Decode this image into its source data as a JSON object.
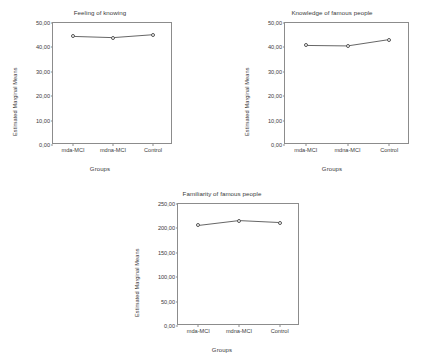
{
  "figure": {
    "background": "#ffffff",
    "axis_color": "#8c8c8c",
    "line_color": "#555555",
    "marker_fill": "#ffffff"
  },
  "chart_data": [
    {
      "type": "line",
      "title": "Feeling of knowing",
      "xlabel": "Groups",
      "ylabel": "Estimated Marginal Means",
      "categories": [
        "mda-MCI",
        "mdna-MCI",
        "Control"
      ],
      "values": [
        44.5,
        44.0,
        45.2
      ],
      "ylim": [
        0,
        50
      ],
      "yticks": [
        "0,00",
        "10,00",
        "20,00",
        "30,00",
        "40,00",
        "50,00"
      ],
      "ytick_values": [
        0,
        10,
        20,
        30,
        40,
        50
      ],
      "grid": false,
      "legend": "none"
    },
    {
      "type": "line",
      "title": "Knowledge of famous people",
      "xlabel": "Groups",
      "ylabel": "Estimated Marginal Means",
      "categories": [
        "mda-MCI",
        "mdna-MCI",
        "Control"
      ],
      "values": [
        40.8,
        40.6,
        43.2
      ],
      "ylim": [
        0,
        50
      ],
      "yticks": [
        "0,00",
        "10,00",
        "20,00",
        "30,00",
        "40,00",
        "50,00"
      ],
      "ytick_values": [
        0,
        10,
        20,
        30,
        40,
        50
      ],
      "grid": false,
      "legend": "none"
    },
    {
      "type": "line",
      "title": "Familiarity of famous people",
      "xlabel": "Groups",
      "ylabel": "Estimated Marginal Means",
      "categories": [
        "mda-MCI",
        "mdna-MCI",
        "Control"
      ],
      "values": [
        206.0,
        216.0,
        212.0
      ],
      "ylim": [
        0,
        250
      ],
      "yticks": [
        "0,00",
        "50,00",
        "100,00",
        "150,00",
        "200,00",
        "250,00"
      ],
      "ytick_values": [
        0,
        50,
        100,
        150,
        200,
        250
      ],
      "grid": false,
      "legend": "none"
    }
  ]
}
